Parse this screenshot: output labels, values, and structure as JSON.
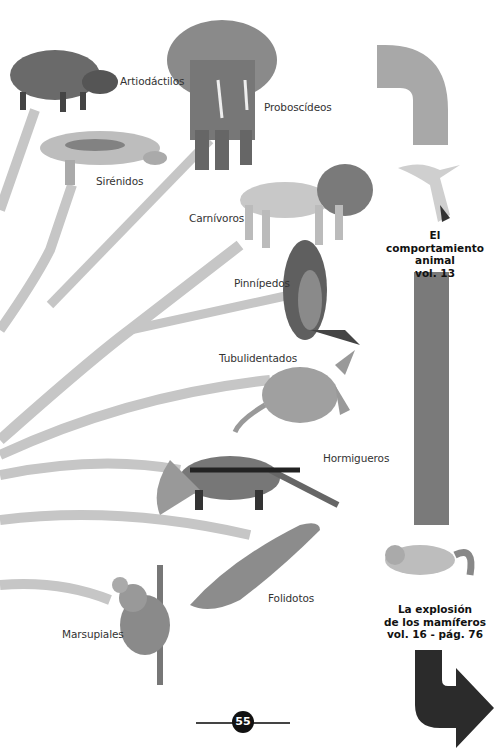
{
  "page": {
    "number": "55"
  },
  "colors": {
    "branch": "#c6c6c6",
    "connector_light": "#a9a9a9",
    "connector_mid": "#777777",
    "connector_dark": "#2b2b2b"
  },
  "tree": {
    "labels": [
      {
        "id": "artiodactilos",
        "text": "Artiodáctilos"
      },
      {
        "id": "proboscideos",
        "text": "Proboscídeos"
      },
      {
        "id": "sirenidos",
        "text": "Sirénidos"
      },
      {
        "id": "carnivoros",
        "text": "Carnívoros"
      },
      {
        "id": "pinnipedos",
        "text": "Pinnípedos"
      },
      {
        "id": "tubulidentados",
        "text": "Tubulidentados"
      },
      {
        "id": "hormigueros",
        "text": "Hormigueros"
      },
      {
        "id": "folidotos",
        "text": "Folidotos"
      },
      {
        "id": "marsupiales",
        "text": "Marsupiales"
      }
    ],
    "animals": [
      "wild-boar",
      "elephant",
      "manatee",
      "lion",
      "seal",
      "aardvark",
      "anteater",
      "pangolin",
      "koala"
    ]
  },
  "references": [
    {
      "title_line1": "El comportamiento",
      "title_line2": "animal",
      "volume": "vol. 13",
      "illustration": "seagull"
    },
    {
      "title_line1": "La explosión",
      "title_line2": "de los mamíferos",
      "volume": "vol. 16 - pág. 76",
      "illustration": "lemur"
    }
  ]
}
